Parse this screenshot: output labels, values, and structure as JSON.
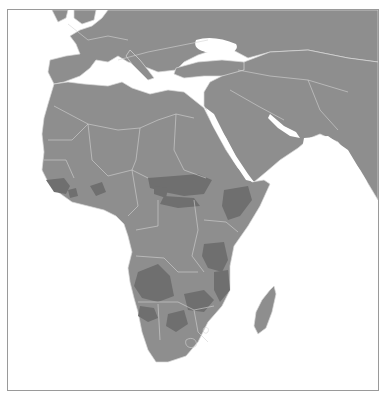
{
  "map": {
    "region": "Africa, Europe and Middle East",
    "style": "grayscale choropleth",
    "colors": {
      "ocean": "#ffffff",
      "land_base": "#8e8e8e",
      "land_highlight": "#6f6f6f",
      "borders": "#d6d6d6",
      "frame": "#9a9a9a"
    },
    "legend": null,
    "highlighted_areas": [
      "West Africa coast (Senegal/Guinea)",
      "Central Nigeria",
      "South Sudan / Sudan",
      "Central African Republic",
      "Ethiopia / Somalia",
      "Tanzania",
      "Angola",
      "Zambia / Mozambique",
      "Botswana",
      "Southern DR Congo"
    ],
    "caption": "Map of Africa with shaded regions"
  }
}
